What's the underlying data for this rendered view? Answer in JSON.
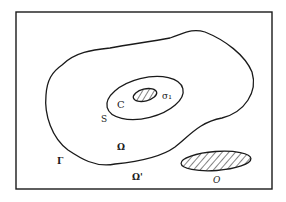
{
  "diagram": {
    "frame_color": "#1a1a1a",
    "labels": {
      "outer_domain": "Ω",
      "exterior_domain": "Ω'",
      "outer_boundary": "Γ",
      "inner_surface": "S",
      "inner_region": "C",
      "inner_obstacle": "σ₁",
      "outer_obstacle": "O"
    },
    "regions": [
      {
        "id": "omega",
        "description": "large irregular domain bounded by Γ"
      },
      {
        "id": "S",
        "description": "ellipse surface enclosing region C"
      },
      {
        "id": "sigma1",
        "description": "small hatched obstacle inside C"
      },
      {
        "id": "O",
        "description": "hatched elliptical obstacle in Ω'"
      }
    ]
  }
}
